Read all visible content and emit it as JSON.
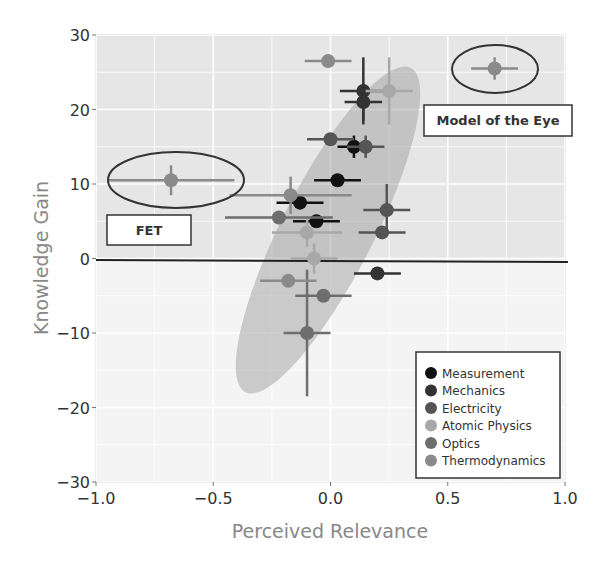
{
  "chart_data": {
    "type": "scatter",
    "title": "",
    "xlabel": "Perceived Relevance",
    "ylabel": "Knowledge Gain",
    "xlim": [
      -1.0,
      1.0
    ],
    "ylim": [
      -30,
      30
    ],
    "xticks": [
      -1.0,
      -0.5,
      0.0,
      0.5,
      1.0
    ],
    "xtick_labels": [
      "−1.0",
      "−0.5",
      "0.0",
      "0.5",
      "1.0"
    ],
    "yticks": [
      30,
      20,
      10,
      0,
      -10,
      -20,
      -30
    ],
    "ytick_labels": [
      "30",
      "20",
      "10",
      "0",
      "−10",
      "−20",
      "−30"
    ],
    "grid": true,
    "zero_line": true,
    "legend_position": "lower right",
    "series": [
      {
        "name": "Measurement",
        "color": "#111111",
        "points": [
          {
            "x": 0.1,
            "y": 15.0,
            "xerr": 0.07,
            "yerr": 1.5
          },
          {
            "x": 0.03,
            "y": 10.5,
            "xerr": 0.1,
            "yerr": 0
          },
          {
            "x": -0.13,
            "y": 7.5,
            "xerr": 0.1,
            "yerr": 0
          },
          {
            "x": -0.06,
            "y": 5.0,
            "xerr": 0.1,
            "yerr": 0
          }
        ]
      },
      {
        "name": "Mechanics",
        "color": "#333333",
        "points": [
          {
            "x": 0.14,
            "y": 22.5,
            "xerr": 0.1,
            "yerr": 4.5
          },
          {
            "x": 0.14,
            "y": 21.0,
            "xerr": 0.08,
            "yerr": 2.5
          },
          {
            "x": 0.2,
            "y": -2.0,
            "xerr": 0.1,
            "yerr": 0
          }
        ]
      },
      {
        "name": "Electricity",
        "color": "#555555",
        "points": [
          {
            "x": 0.15,
            "y": 15.0,
            "xerr": 0.08,
            "yerr": 1.5
          },
          {
            "x": 0.24,
            "y": 6.5,
            "xerr": 0.1,
            "yerr": 3.5
          },
          {
            "x": 0.22,
            "y": 3.5,
            "xerr": 0.1,
            "yerr": 0
          },
          {
            "x": 0.0,
            "y": 16.0,
            "xerr": 0.1,
            "yerr": 0
          }
        ]
      },
      {
        "name": "Atomic Physics",
        "color": "#a8a8a8",
        "points": [
          {
            "x": 0.25,
            "y": 22.5,
            "xerr": 0.1,
            "yerr": 4.5
          },
          {
            "x": -0.1,
            "y": 3.5,
            "xerr": 0.15,
            "yerr": 2.0
          },
          {
            "x": -0.07,
            "y": 0.0,
            "xerr": 0.1,
            "yerr": 2.0
          }
        ]
      },
      {
        "name": "Optics",
        "color": "#6e6e6e",
        "points": [
          {
            "x": -0.22,
            "y": 5.5,
            "xerr": 0.23,
            "yerr": 0
          },
          {
            "x": -0.03,
            "y": -5.0,
            "xerr": 0.12,
            "yerr": 0
          },
          {
            "x": -0.1,
            "y": -10.0,
            "xerr": 0.1,
            "yerr": 8.5
          }
        ]
      },
      {
        "name": "Thermodynamics",
        "color": "#8a8a8a",
        "points": [
          {
            "x": -0.01,
            "y": 26.5,
            "xerr": 0.1,
            "yerr": 0
          },
          {
            "x": -0.17,
            "y": 8.5,
            "xerr": 0.26,
            "yerr": 2.5
          },
          {
            "x": -0.18,
            "y": -3.0,
            "xerr": 0.12,
            "yerr": 0
          },
          {
            "x": -0.68,
            "y": 10.5,
            "xerr": 0.27,
            "yerr": 2.0
          },
          {
            "x": 0.7,
            "y": 25.5,
            "xerr": 0.1,
            "yerr": 1.5
          }
        ]
      }
    ],
    "annotations": [
      {
        "label": "FET",
        "x": -0.68,
        "y": 10.5
      },
      {
        "label": "Model of the Eye",
        "x": 0.7,
        "y": 25.5
      }
    ],
    "confidence_ellipse": {
      "center_x": 0.0,
      "center_y": 4.0,
      "description": "shaded ellipse tilted along positive correlation"
    }
  },
  "legend": {
    "items": [
      {
        "label": "Measurement",
        "color": "#111111"
      },
      {
        "label": "Mechanics",
        "color": "#333333"
      },
      {
        "label": "Electricity",
        "color": "#555555"
      },
      {
        "label": "Atomic Physics",
        "color": "#a8a8a8"
      },
      {
        "label": "Optics",
        "color": "#6e6e6e"
      },
      {
        "label": "Thermodynamics",
        "color": "#8a8a8a"
      }
    ]
  },
  "axes": {
    "xlabel": "Perceived Relevance",
    "ylabel": "Knowledge Gain"
  },
  "annotations": {
    "fet": "FET",
    "eye": "Model of the Eye"
  }
}
